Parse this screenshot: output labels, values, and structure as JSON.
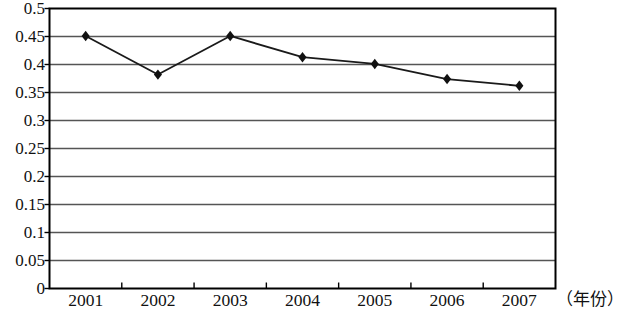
{
  "chart_data": {
    "type": "line",
    "title": "",
    "xlabel": "（年份）",
    "ylabel": "",
    "categories": [
      "2001",
      "2002",
      "2003",
      "2004",
      "2005",
      "2006",
      "2007"
    ],
    "values": [
      0.451,
      0.382,
      0.451,
      0.413,
      0.401,
      0.374,
      0.362
    ],
    "series": [
      {
        "name": "",
        "values": [
          0.451,
          0.382,
          0.451,
          0.413,
          0.401,
          0.374,
          0.362
        ]
      }
    ],
    "ylim": [
      0,
      0.5
    ],
    "ytick_labels": [
      "0",
      "0.05",
      "0.1",
      "0.15",
      "0.2",
      "0.25",
      "0.3",
      "0.35",
      "0.4",
      "0.45",
      "0.5"
    ],
    "ytick_values": [
      0,
      0.05,
      0.1,
      0.15,
      0.2,
      0.25,
      0.3,
      0.35,
      0.4,
      0.45,
      0.5
    ],
    "grid": "horizontal",
    "legend": "none",
    "marker": "diamond",
    "line_color": "#1a1a1a",
    "marker_color": "#111111",
    "grid_color": "#555555",
    "axis_color": "#000000",
    "background": "#ffffff"
  }
}
